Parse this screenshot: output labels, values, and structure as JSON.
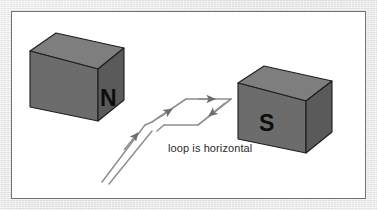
{
  "figure": {
    "background_color": "#e8e8e8",
    "frame_color": "#ffffff",
    "frame_border_color": "#6e7276"
  },
  "magnets": [
    {
      "id": "north-magnet",
      "label": "N",
      "pole": "north",
      "face_color": "#6b6b6b",
      "top_color": "#7e7e7e",
      "side_color": "#585858",
      "edge_color": "#1d1d1d",
      "label_color": "#0d0d0d",
      "label_x": 95,
      "label_y": 88
    },
    {
      "id": "south-magnet",
      "label": "S",
      "pole": "south",
      "face_color": "#6b6b6b",
      "top_color": "#7e7e7e",
      "side_color": "#585858",
      "edge_color": "#1d1d1d",
      "label_color": "#0d0d0d",
      "label_x": 275,
      "label_y": 113
    }
  ],
  "loop": {
    "id": "current-loop",
    "shape": "parallelogram",
    "stroke_color": "#8a8a8a",
    "stroke_width": 1.6,
    "arrow_color": "#6e6e6e",
    "orientation_note": "loop is horizontal",
    "arrows": [
      {
        "name": "top-edge-arrow",
        "direction": "right"
      },
      {
        "name": "right-edge-arrow",
        "direction": "down-left"
      },
      {
        "name": "left-edge-arrow",
        "direction": "up-right"
      },
      {
        "name": "lead-wire-arrow",
        "direction": "up-right"
      }
    ]
  },
  "leads": {
    "id": "lead-wires",
    "count": 2,
    "stroke_color": "#8a8a8a",
    "direction": "down-left"
  },
  "annotations": {
    "loop_caption": "loop is horizontal",
    "caption_color": "#2b2b2b",
    "caption_x": 166,
    "caption_y": 147
  }
}
